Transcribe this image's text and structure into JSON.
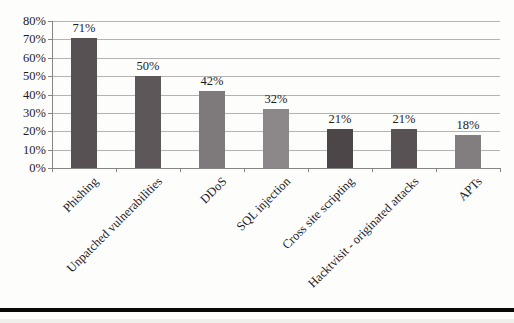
{
  "chart_data": {
    "type": "bar",
    "categories": [
      "Phishing",
      "Unpatched vulnerabilities",
      "DDoS",
      "SQL injection",
      "Cross site scripting",
      "Hacktvisit - originated attacks",
      "APTs"
    ],
    "values": [
      71,
      50,
      42,
      32,
      21,
      21,
      18
    ],
    "value_labels": [
      "71%",
      "50%",
      "42%",
      "32%",
      "21%",
      "21%",
      "18%"
    ],
    "bar_colors": [
      "#575153",
      "#5e5759",
      "#7e797a",
      "#8c8889",
      "#4c4648",
      "#585254",
      "#827d7e"
    ],
    "title": "",
    "xlabel": "",
    "ylabel": "",
    "ylim": [
      0,
      80
    ],
    "ytick_step": 10,
    "ytick_labels": [
      "0%",
      "10%",
      "20%",
      "30%",
      "40%",
      "50%",
      "60%",
      "70%",
      "80%"
    ],
    "grid": true,
    "legend": false,
    "category_label_rotation_deg": -45
  },
  "colors": {
    "gridline": "#b5b2b3",
    "axis": "#858384",
    "text": "#1e1c1d",
    "separator": "#080808",
    "background": "#fdfdfc"
  }
}
